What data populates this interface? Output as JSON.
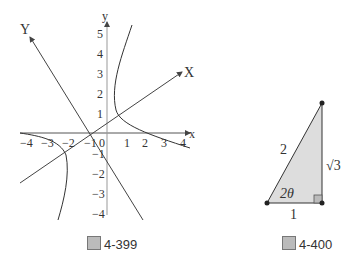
{
  "figures": [
    {
      "caption": "4-399",
      "caption_glyph": "圖",
      "axes": {
        "x_label": "x",
        "y_label": "y",
        "rotated_x_label": "X",
        "rotated_y_label": "Y"
      },
      "x_ticks": [
        "−4",
        "−3",
        "−2",
        "−1",
        "0",
        "1",
        "2",
        "3",
        "4"
      ],
      "y_ticks": [
        "5",
        "4",
        "3",
        "2",
        "1",
        "−1",
        "−2",
        "−3",
        "−4"
      ]
    },
    {
      "caption": "4-400",
      "caption_glyph": "圖",
      "hypotenuse": "2",
      "base": "1",
      "height": "√3",
      "angle": "2θ"
    }
  ]
}
